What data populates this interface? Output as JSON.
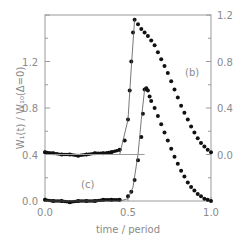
{
  "chart_data": {
    "type": "scatter",
    "title": "",
    "xlabel": "time / period",
    "ylabel_left": "W_I(t) / W_I0(Δ=0)",
    "ylabel_right": "",
    "xlim": [
      0.0,
      1.0
    ],
    "ylim_left": [
      0.0,
      1.6
    ],
    "ylim_right": [
      -0.4,
      1.2
    ],
    "x_ticks": [
      "0.0",
      "0.5",
      "1.0"
    ],
    "y_ticks_left": [
      "0.0",
      "0.4",
      "0.8",
      "1.2"
    ],
    "y_ticks_right": [
      "0.0",
      "0.4",
      "0.8",
      "1.2"
    ],
    "grid": false,
    "annotations": [
      "(b)",
      "(c)"
    ],
    "series": [
      {
        "name": "(b) measured",
        "style": "dots",
        "axis": "right",
        "x": [
          0.0,
          0.05,
          0.1,
          0.15,
          0.2,
          0.25,
          0.3,
          0.35,
          0.4,
          0.45,
          0.48,
          0.5,
          0.51,
          0.52,
          0.53,
          0.54,
          0.56,
          0.58,
          0.6,
          0.62,
          0.64,
          0.66,
          0.68,
          0.7,
          0.72,
          0.74,
          0.76,
          0.78,
          0.8,
          0.82,
          0.84,
          0.86,
          0.88,
          0.9,
          0.92,
          0.94,
          0.96,
          0.98,
          1.0
        ],
        "values": [
          0.02,
          0.01,
          0.0,
          0.0,
          -0.01,
          0.0,
          0.01,
          0.01,
          0.02,
          0.04,
          0.12,
          0.3,
          0.55,
          0.8,
          1.05,
          1.16,
          1.12,
          1.08,
          1.05,
          1.02,
          0.98,
          0.94,
          0.88,
          0.82,
          0.76,
          0.7,
          0.63,
          0.56,
          0.49,
          0.42,
          0.36,
          0.3,
          0.24,
          0.19,
          0.14,
          0.1,
          0.07,
          0.04,
          0.02
        ]
      },
      {
        "name": "(b) theory",
        "style": "line",
        "axis": "right",
        "x": [
          0.0,
          0.3,
          0.45,
          0.5,
          0.52,
          0.54
        ],
        "values": [
          0.0,
          0.0,
          0.0,
          0.3,
          0.75,
          1.16
        ]
      },
      {
        "name": "(c) measured",
        "style": "dots",
        "axis": "left",
        "x": [
          0.0,
          0.05,
          0.1,
          0.15,
          0.2,
          0.25,
          0.3,
          0.35,
          0.4,
          0.45,
          0.5,
          0.52,
          0.54,
          0.56,
          0.58,
          0.59,
          0.6,
          0.61,
          0.62,
          0.63,
          0.64,
          0.66,
          0.68,
          0.7,
          0.72,
          0.74,
          0.76,
          0.78,
          0.8,
          0.82,
          0.84,
          0.86,
          0.88,
          0.9,
          0.92,
          0.94,
          0.96,
          0.98,
          1.0
        ],
        "values": [
          0.01,
          0.0,
          0.0,
          -0.01,
          0.0,
          0.0,
          0.0,
          0.01,
          0.01,
          0.01,
          0.04,
          0.08,
          0.18,
          0.35,
          0.55,
          0.75,
          0.96,
          0.97,
          0.95,
          0.9,
          0.86,
          0.8,
          0.73,
          0.66,
          0.59,
          0.52,
          0.45,
          0.38,
          0.32,
          0.26,
          0.21,
          0.16,
          0.12,
          0.09,
          0.06,
          0.04,
          0.02,
          0.01,
          0.0
        ]
      },
      {
        "name": "(c) theory",
        "style": "line",
        "axis": "left",
        "x": [
          0.0,
          0.45,
          0.5,
          0.53,
          0.56,
          0.58,
          0.6
        ],
        "values": [
          0.0,
          0.0,
          0.02,
          0.12,
          0.4,
          0.7,
          0.96
        ]
      },
      {
        "name": "(b) baseline",
        "style": "line",
        "axis": "right",
        "x": [
          0.0,
          0.6
        ],
        "values": [
          0.0,
          0.0
        ]
      }
    ]
  },
  "labels": {
    "ylabel": "W₁(t) / W₁₀(Δ=0)",
    "xlabel": "time / period",
    "b": "(b)",
    "c": "(c)"
  }
}
